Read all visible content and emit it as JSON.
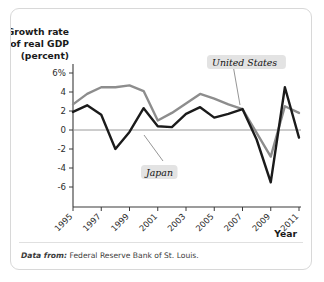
{
  "figure": {
    "source_lead": "Data from:",
    "source_text": "Federal Reserve Bank of St. Louis."
  },
  "chart_data": {
    "type": "line",
    "title": "",
    "ylabel_lines": [
      "Growth rate",
      "of real GDP",
      "(percent)"
    ],
    "xlabel": "Year",
    "x": [
      1995,
      1996,
      1997,
      1998,
      1999,
      2000,
      2001,
      2002,
      2003,
      2004,
      2005,
      2006,
      2007,
      2008,
      2009,
      2010,
      2011
    ],
    "xtick_labels": [
      "1995",
      "1997",
      "1999",
      "2001",
      "2003",
      "2005",
      "2007",
      "2009",
      "2011"
    ],
    "xticks": [
      1995,
      1997,
      1999,
      2001,
      2003,
      2005,
      2007,
      2009,
      2011
    ],
    "ytick_labels": [
      "6%",
      "4",
      "2",
      "0",
      "-2",
      "-4",
      "-6"
    ],
    "yticks": [
      6,
      4,
      2,
      0,
      -2,
      -4,
      -6
    ],
    "ylim": [
      -7.4,
      6.6
    ],
    "xlim": [
      1995,
      2011
    ],
    "grid": false,
    "zero_line": true,
    "legend_position": "inline-annotations",
    "series": [
      {
        "name": "United States",
        "color": "#8d8d8d",
        "label_anchor": {
          "x": 2006.1,
          "y": 3.05
        },
        "values": [
          2.7,
          3.8,
          4.5,
          4.5,
          4.7,
          4.1,
          1.0,
          1.8,
          2.8,
          3.8,
          3.3,
          2.7,
          2.2,
          -0.3,
          -2.8,
          2.5,
          1.8
        ]
      },
      {
        "name": "Japan",
        "color": "#1b1b1b",
        "label_anchor": {
          "x": 1999.5,
          "y": -2.1
        },
        "values": [
          1.9,
          2.6,
          1.6,
          -2.0,
          -0.2,
          2.3,
          0.4,
          0.3,
          1.7,
          2.4,
          1.3,
          1.7,
          2.2,
          -1.0,
          -5.5,
          4.5,
          -0.8
        ]
      }
    ],
    "annotations": [
      {
        "text": "United States",
        "x": 2006.1,
        "y": 3.05
      },
      {
        "text": "Japan",
        "x": 1999.5,
        "y": -2.1
      }
    ]
  }
}
